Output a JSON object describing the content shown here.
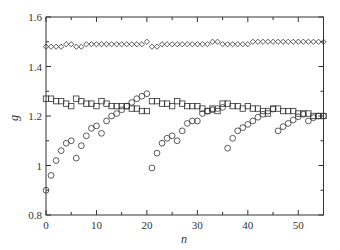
{
  "chart_data": {
    "type": "scatter",
    "title": "",
    "xlabel": "n",
    "ylabel": "g",
    "xlim": [
      0,
      55
    ],
    "ylim": [
      0.8,
      1.6
    ],
    "x_ticks": [
      0,
      10,
      20,
      30,
      40,
      50
    ],
    "x_tick_labels": [
      "0",
      "10",
      "20",
      "30",
      "40",
      "50"
    ],
    "x_minor_ticks": [
      5,
      15,
      25,
      35,
      45
    ],
    "y_ticks": [
      0.8,
      1.0,
      1.2,
      1.4,
      1.6
    ],
    "y_tick_labels": [
      "0.8",
      "1",
      "1.2",
      "1.4",
      "1.6"
    ],
    "y_minor_ticks": [
      0.9,
      1.1,
      1.3,
      1.5
    ],
    "grid": false,
    "legend": null,
    "series": [
      {
        "name": "diamonds",
        "marker": "diamond",
        "x": [
          0,
          1,
          2,
          3,
          4,
          5,
          6,
          7,
          8,
          9,
          10,
          11,
          12,
          13,
          14,
          15,
          16,
          17,
          18,
          19,
          20,
          21,
          22,
          23,
          24,
          25,
          26,
          27,
          28,
          29,
          30,
          31,
          32,
          33,
          34,
          35,
          36,
          37,
          38,
          39,
          40,
          41,
          42,
          43,
          44,
          45,
          46,
          47,
          48,
          49,
          50,
          51,
          52,
          53,
          54,
          55
        ],
        "values": [
          1.48,
          1.48,
          1.48,
          1.48,
          1.49,
          1.49,
          1.48,
          1.48,
          1.49,
          1.49,
          1.49,
          1.49,
          1.49,
          1.49,
          1.49,
          1.49,
          1.49,
          1.49,
          1.49,
          1.49,
          1.5,
          1.48,
          1.48,
          1.49,
          1.49,
          1.49,
          1.49,
          1.49,
          1.49,
          1.49,
          1.49,
          1.49,
          1.49,
          1.5,
          1.5,
          1.49,
          1.49,
          1.49,
          1.49,
          1.49,
          1.49,
          1.5,
          1.5,
          1.5,
          1.5,
          1.5,
          1.5,
          1.5,
          1.5,
          1.5,
          1.5,
          1.5,
          1.5,
          1.5,
          1.5,
          1.5
        ]
      },
      {
        "name": "squares",
        "marker": "square",
        "x": [
          0,
          1,
          2,
          3,
          4,
          5,
          6,
          7,
          8,
          9,
          10,
          11,
          12,
          13,
          14,
          15,
          16,
          17,
          18,
          19,
          20,
          21,
          22,
          23,
          24,
          25,
          26,
          27,
          28,
          29,
          30,
          31,
          32,
          33,
          34,
          35,
          36,
          37,
          38,
          39,
          40,
          41,
          42,
          43,
          44,
          45,
          46,
          47,
          48,
          49,
          50,
          51,
          52,
          53,
          54,
          55
        ],
        "values": [
          1.27,
          1.27,
          1.26,
          1.26,
          1.25,
          1.24,
          1.27,
          1.26,
          1.25,
          1.25,
          1.24,
          1.26,
          1.25,
          1.24,
          1.24,
          1.24,
          1.24,
          1.23,
          1.23,
          1.22,
          1.22,
          1.26,
          1.26,
          1.25,
          1.25,
          1.24,
          1.26,
          1.25,
          1.24,
          1.24,
          1.24,
          1.23,
          1.22,
          1.23,
          1.22,
          1.25,
          1.25,
          1.24,
          1.24,
          1.23,
          1.24,
          1.23,
          1.23,
          1.22,
          1.21,
          1.23,
          1.23,
          1.22,
          1.22,
          1.22,
          1.21,
          1.21,
          1.21,
          1.2,
          1.2,
          1.2
        ]
      },
      {
        "name": "circles",
        "marker": "circle",
        "x": [
          0,
          1,
          2,
          3,
          4,
          5,
          6,
          7,
          8,
          9,
          10,
          11,
          12,
          13,
          14,
          15,
          16,
          17,
          18,
          19,
          20,
          21,
          22,
          23,
          24,
          25,
          26,
          27,
          28,
          29,
          30,
          31,
          32,
          33,
          34,
          35,
          36,
          37,
          38,
          39,
          40,
          41,
          42,
          43,
          44,
          45,
          46,
          47,
          48,
          49,
          50,
          51,
          52,
          53,
          54,
          55
        ],
        "values": [
          0.9,
          0.96,
          1.02,
          1.06,
          1.09,
          1.1,
          1.03,
          1.08,
          1.12,
          1.15,
          1.16,
          1.13,
          1.18,
          1.2,
          1.21,
          1.225,
          1.24,
          1.255,
          1.27,
          1.28,
          1.29,
          0.99,
          1.05,
          1.09,
          1.11,
          1.12,
          1.1,
          1.14,
          1.17,
          1.18,
          1.18,
          1.21,
          1.22,
          1.225,
          1.23,
          1.235,
          1.07,
          1.11,
          1.14,
          1.153,
          1.166,
          1.18,
          1.195,
          1.207,
          1.22,
          1.228,
          1.14,
          1.157,
          1.17,
          1.184,
          1.197,
          1.207,
          1.18,
          1.193,
          1.2,
          1.2
        ]
      }
    ]
  },
  "colors": {
    "axis": "#333333",
    "marker_stroke": "#333333",
    "background": "#ffffff"
  }
}
